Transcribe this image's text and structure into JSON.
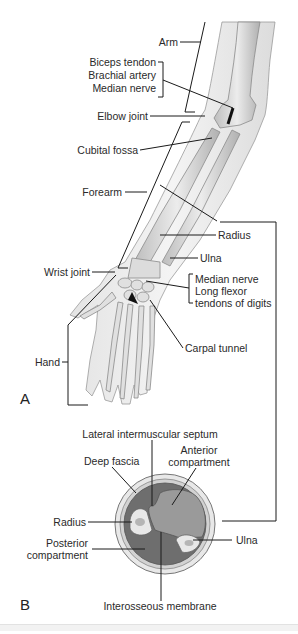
{
  "figure": {
    "panel_a": {
      "letter": "A",
      "labels": {
        "arm": "Arm",
        "biceps_tendon": "Biceps tendon",
        "brachial_artery": "Brachial artery",
        "median_nerve_upper": "Median nerve",
        "elbow_joint": "Elbow joint",
        "cubital_fossa": "Cubital fossa",
        "forearm": "Forearm",
        "radius": "Radius",
        "ulna": "Ulna",
        "wrist_joint": "Wrist joint",
        "median_nerve_lower": "Median nerve",
        "long_flexor": "Long flexor",
        "tendons_of_digits": "tendons of digits",
        "carpal_tunnel": "Carpal tunnel",
        "hand": "Hand"
      }
    },
    "panel_b": {
      "letter": "B",
      "labels": {
        "lateral_intermuscular_septum": "Lateral intermuscular septum",
        "deep_fascia": "Deep fascia",
        "anterior": "Anterior",
        "compartment_anterior": "compartment",
        "radius": "Radius",
        "posterior": "Posterior",
        "compartment_posterior": "compartment",
        "ulna": "Ulna",
        "interosseous_membrane": "Interosseous membrane"
      }
    },
    "colors": {
      "line": "#1a1a1a",
      "bone_fill": "#e6e6e6",
      "bone_stroke": "#8a8a8a",
      "skin_fill": "#f0f0f0",
      "anterior_compartment": "#9a9a9a",
      "posterior_compartment": "#6e6e6e",
      "fascia_ring": "#d4d4d4"
    }
  }
}
